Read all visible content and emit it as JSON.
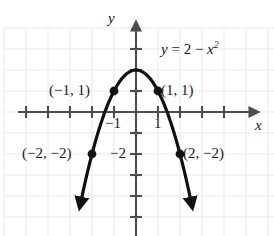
{
  "figure": {
    "equation_label": {
      "lhs": "y",
      "equals": "=",
      "rhs_constant": "2",
      "minus": "−",
      "variable": "x",
      "exponent": "2",
      "full_text": "y = 2 − x²"
    },
    "axes": {
      "x_label": "x",
      "y_label": "y",
      "x_tick_labels": [
        "−1",
        "1"
      ],
      "y_tick_labels": [
        "−2"
      ],
      "axis_color": "#4d4d4d",
      "grid_color": "#e9e9ec",
      "curve_color": "#111111"
    },
    "point_labels": [
      {
        "text": "(−1, 1)",
        "x": -1,
        "y": 1
      },
      {
        "text": "(1, 1)",
        "x": 1,
        "y": 1
      },
      {
        "text": "(−2, −2)",
        "x": -2,
        "y": -2
      },
      {
        "text": "(2, −2)",
        "x": 2,
        "y": -2
      }
    ]
  },
  "chart_data": {
    "type": "line",
    "title": "",
    "subtitle": "",
    "equation": "y = 2 - x^2",
    "xlabel": "x",
    "ylabel": "y",
    "xlim": [
      -6,
      6
    ],
    "ylim": [
      -6,
      4
    ],
    "grid": true,
    "legend": "none",
    "x_ticks": [
      -1,
      1
    ],
    "x_tick_labels": [
      "−1",
      "1"
    ],
    "y_ticks": [
      -2
    ],
    "y_tick_labels": [
      "−2"
    ],
    "series": [
      {
        "name": "y = 2 - x^2",
        "x": [
          -2.55,
          -2.25,
          -2.0,
          -1.75,
          -1.5,
          -1.25,
          -1.0,
          -0.75,
          -0.5,
          -0.25,
          0,
          0.25,
          0.5,
          0.75,
          1.0,
          1.25,
          1.5,
          1.75,
          2.0,
          2.25,
          2.55
        ],
        "values": [
          -4.5,
          -3.06,
          -2.0,
          -1.06,
          -0.25,
          0.44,
          1.0,
          1.44,
          1.75,
          1.94,
          2.0,
          1.94,
          1.75,
          1.44,
          1.0,
          0.44,
          -0.25,
          -1.06,
          -2.0,
          -3.06,
          -4.5
        ]
      }
    ],
    "annotated_points": [
      {
        "label": "(−1, 1)",
        "x": -1,
        "y": 1
      },
      {
        "label": "(1, 1)",
        "x": 1,
        "y": 1
      },
      {
        "label": "(−2, −2)",
        "x": -2,
        "y": -2
      },
      {
        "label": "(2, −2)",
        "x": 2,
        "y": -2
      }
    ],
    "vertex": {
      "x": 0,
      "y": 2
    }
  }
}
